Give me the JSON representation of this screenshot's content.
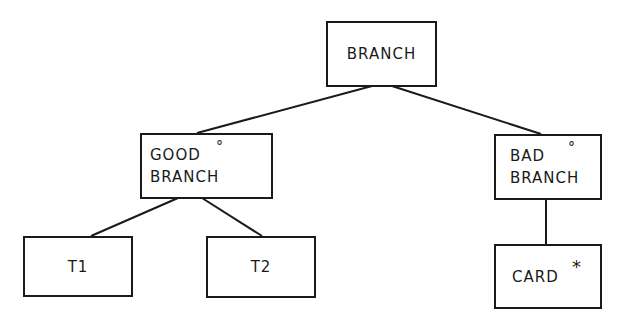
{
  "diagram": {
    "type": "tree",
    "nodes": [
      {
        "id": "branch",
        "lines": [
          "BRANCH"
        ],
        "mark": ""
      },
      {
        "id": "good-branch",
        "lines": [
          "GOOD",
          "BRANCH"
        ],
        "mark": "°"
      },
      {
        "id": "bad-branch",
        "lines": [
          "BAD",
          "BRANCH"
        ],
        "mark": "°"
      },
      {
        "id": "t1",
        "lines": [
          "T1"
        ],
        "mark": ""
      },
      {
        "id": "t2",
        "lines": [
          "T2"
        ],
        "mark": ""
      },
      {
        "id": "card",
        "lines": [
          "CARD"
        ],
        "mark": "*"
      }
    ],
    "edges": [
      {
        "from": "branch",
        "to": "good-branch"
      },
      {
        "from": "branch",
        "to": "bad-branch"
      },
      {
        "from": "good-branch",
        "to": "t1"
      },
      {
        "from": "good-branch",
        "to": "t2"
      },
      {
        "from": "bad-branch",
        "to": "card"
      }
    ],
    "colors": {
      "stroke": "#1a1a1a",
      "background": "#ffffff"
    }
  }
}
